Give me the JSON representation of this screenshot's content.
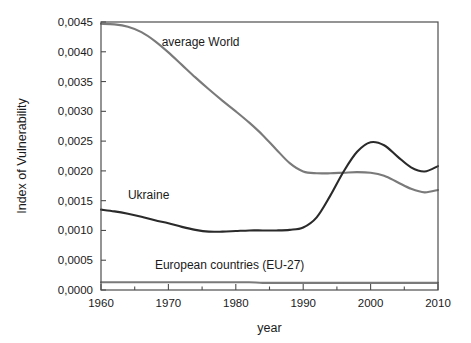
{
  "chart_data": {
    "type": "line",
    "title": "",
    "xlabel": "year",
    "ylabel": "Index of Vulnerability",
    "xlim": [
      1960,
      2010
    ],
    "ylim": [
      0.0,
      0.0045
    ],
    "grid": false,
    "legend_position": "inline-labels",
    "decimal_separator": ",",
    "x_ticks_major": [
      1960,
      1970,
      1980,
      1990,
      2000,
      2010
    ],
    "x_tick_labels": [
      "1960",
      "1970",
      "1980",
      "1990",
      "2000",
      "2010"
    ],
    "x_ticks_minor": [
      1965,
      1975,
      1985,
      1995,
      2005
    ],
    "y_ticks_major": [
      0.0,
      0.0005,
      0.001,
      0.0015,
      0.002,
      0.0025,
      0.003,
      0.0035,
      0.004,
      0.0045
    ],
    "y_tick_labels": [
      "0,0000",
      "0,0005",
      "0,0010",
      "0,0015",
      "0,0020",
      "0,0025",
      "0,0030",
      "0,0035",
      "0,0040",
      "0,0045"
    ],
    "x": [
      1960,
      1962,
      1964,
      1966,
      1968,
      1970,
      1972,
      1974,
      1976,
      1978,
      1980,
      1982,
      1984,
      1986,
      1988,
      1990,
      1992,
      1994,
      1996,
      1998,
      2000,
      2002,
      2004,
      2006,
      2008,
      2010
    ],
    "series": [
      {
        "name": "average World",
        "label": "average World",
        "color": "#7a7a7a",
        "label_x": 1969,
        "label_y": 0.0041,
        "values": [
          0.00447,
          0.00446,
          0.00442,
          0.00433,
          0.00418,
          0.00399,
          0.00378,
          0.00357,
          0.00337,
          0.00318,
          0.003,
          0.00281,
          0.0026,
          0.00236,
          0.00213,
          0.00199,
          0.00196,
          0.00196,
          0.00197,
          0.00198,
          0.00197,
          0.00192,
          0.00181,
          0.0017,
          0.00164,
          0.00168
        ]
      },
      {
        "name": "Ukraine",
        "label": "Ukraine",
        "color": "#2a2a2a",
        "label_x": 1964,
        "label_y": 0.00152,
        "values": [
          0.00135,
          0.00132,
          0.00128,
          0.00123,
          0.00117,
          0.00112,
          0.00106,
          0.00101,
          0.00098,
          0.00098,
          0.00099,
          0.001,
          0.001,
          0.001,
          0.00101,
          0.00105,
          0.00122,
          0.00158,
          0.00199,
          0.00232,
          0.00248,
          0.00243,
          0.00224,
          0.00206,
          0.00199,
          0.00208
        ]
      },
      {
        "name": "European countries (EU-27)",
        "label": "European countries (EU-27)",
        "color": "#7a7a7a",
        "label_x": 1968,
        "label_y": 0.00035,
        "values": [
          0.00013,
          0.00013,
          0.00013,
          0.00013,
          0.00013,
          0.00013,
          0.00013,
          0.00013,
          0.00013,
          0.00013,
          0.00013,
          0.00013,
          0.00012,
          0.00012,
          0.00012,
          0.00012,
          0.00012,
          0.00012,
          0.00012,
          0.00012,
          0.00012,
          0.00012,
          0.00012,
          0.00012,
          0.00012,
          0.00012
        ]
      }
    ]
  },
  "plot": {
    "left": 101,
    "right": 438,
    "top": 22,
    "bottom": 290
  }
}
